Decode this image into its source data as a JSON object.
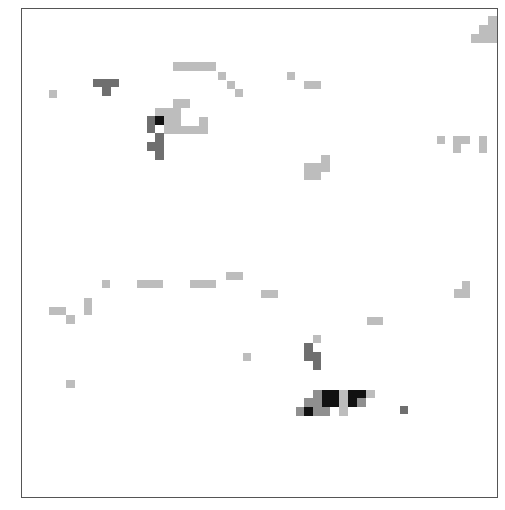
{
  "chart_data": {
    "type": "heatmap",
    "title": "",
    "xlabel": "",
    "ylabel": "",
    "grid": false,
    "legend": null,
    "frame": {
      "x": 21,
      "y": 8,
      "width": 477,
      "height": 490
    },
    "palette": {
      "light": "#bdbdbd",
      "mid": "#8f8f8f",
      "dark": "#6f6f6f",
      "black": "#111111"
    },
    "cells": [
      {
        "x": 488,
        "y": 16,
        "w": 9,
        "h": 9,
        "level": "light"
      },
      {
        "x": 479,
        "y": 25,
        "w": 18,
        "h": 9,
        "level": "light"
      },
      {
        "x": 471,
        "y": 34,
        "w": 26,
        "h": 9,
        "level": "light"
      },
      {
        "x": 173,
        "y": 62,
        "w": 43,
        "h": 9,
        "level": "light"
      },
      {
        "x": 218,
        "y": 72,
        "w": 8,
        "h": 8,
        "level": "light"
      },
      {
        "x": 227,
        "y": 81,
        "w": 8,
        "h": 8,
        "level": "light"
      },
      {
        "x": 235,
        "y": 89,
        "w": 8,
        "h": 8,
        "level": "light"
      },
      {
        "x": 287,
        "y": 72,
        "w": 8,
        "h": 8,
        "level": "light"
      },
      {
        "x": 304,
        "y": 81,
        "w": 17,
        "h": 8,
        "level": "light"
      },
      {
        "x": 49,
        "y": 90,
        "w": 8,
        "h": 8,
        "level": "light"
      },
      {
        "x": 93,
        "y": 79,
        "w": 26,
        "h": 8,
        "level": "dark"
      },
      {
        "x": 102,
        "y": 87,
        "w": 9,
        "h": 9,
        "level": "dark"
      },
      {
        "x": 173,
        "y": 99,
        "w": 17,
        "h": 9,
        "level": "light"
      },
      {
        "x": 155,
        "y": 108,
        "w": 26,
        "h": 9,
        "level": "light"
      },
      {
        "x": 164,
        "y": 117,
        "w": 17,
        "h": 9,
        "level": "light"
      },
      {
        "x": 199,
        "y": 117,
        "w": 9,
        "h": 9,
        "level": "light"
      },
      {
        "x": 164,
        "y": 126,
        "w": 44,
        "h": 8,
        "level": "light"
      },
      {
        "x": 147,
        "y": 116,
        "w": 8,
        "h": 17,
        "level": "dark"
      },
      {
        "x": 155,
        "y": 116,
        "w": 9,
        "h": 9,
        "level": "black"
      },
      {
        "x": 155,
        "y": 133,
        "w": 9,
        "h": 9,
        "level": "dark"
      },
      {
        "x": 147,
        "y": 142,
        "w": 17,
        "h": 9,
        "level": "dark"
      },
      {
        "x": 155,
        "y": 151,
        "w": 9,
        "h": 9,
        "level": "dark"
      },
      {
        "x": 437,
        "y": 136,
        "w": 8,
        "h": 8,
        "level": "light"
      },
      {
        "x": 453,
        "y": 136,
        "w": 17,
        "h": 8,
        "level": "light"
      },
      {
        "x": 453,
        "y": 144,
        "w": 8,
        "h": 9,
        "level": "light"
      },
      {
        "x": 479,
        "y": 136,
        "w": 8,
        "h": 17,
        "level": "light"
      },
      {
        "x": 321,
        "y": 155,
        "w": 9,
        "h": 9,
        "level": "light"
      },
      {
        "x": 304,
        "y": 163,
        "w": 26,
        "h": 9,
        "level": "light"
      },
      {
        "x": 304,
        "y": 172,
        "w": 17,
        "h": 8,
        "level": "light"
      },
      {
        "x": 226,
        "y": 272,
        "w": 17,
        "h": 8,
        "level": "light"
      },
      {
        "x": 102,
        "y": 280,
        "w": 8,
        "h": 8,
        "level": "light"
      },
      {
        "x": 137,
        "y": 280,
        "w": 26,
        "h": 8,
        "level": "light"
      },
      {
        "x": 190,
        "y": 280,
        "w": 26,
        "h": 8,
        "level": "light"
      },
      {
        "x": 261,
        "y": 290,
        "w": 17,
        "h": 8,
        "level": "light"
      },
      {
        "x": 462,
        "y": 281,
        "w": 8,
        "h": 8,
        "level": "light"
      },
      {
        "x": 454,
        "y": 289,
        "w": 16,
        "h": 9,
        "level": "light"
      },
      {
        "x": 84,
        "y": 298,
        "w": 8,
        "h": 17,
        "level": "light"
      },
      {
        "x": 49,
        "y": 307,
        "w": 17,
        "h": 8,
        "level": "light"
      },
      {
        "x": 66,
        "y": 315,
        "w": 9,
        "h": 9,
        "level": "light"
      },
      {
        "x": 367,
        "y": 317,
        "w": 16,
        "h": 8,
        "level": "light"
      },
      {
        "x": 313,
        "y": 335,
        "w": 8,
        "h": 8,
        "level": "light"
      },
      {
        "x": 304,
        "y": 343,
        "w": 9,
        "h": 18,
        "level": "dark"
      },
      {
        "x": 313,
        "y": 352,
        "w": 8,
        "h": 18,
        "level": "dark"
      },
      {
        "x": 243,
        "y": 353,
        "w": 8,
        "h": 8,
        "level": "light"
      },
      {
        "x": 66,
        "y": 380,
        "w": 9,
        "h": 8,
        "level": "light"
      },
      {
        "x": 313,
        "y": 390,
        "w": 9,
        "h": 8,
        "level": "mid"
      },
      {
        "x": 322,
        "y": 390,
        "w": 17,
        "h": 17,
        "level": "black"
      },
      {
        "x": 339,
        "y": 390,
        "w": 9,
        "h": 26,
        "level": "light"
      },
      {
        "x": 348,
        "y": 390,
        "w": 18,
        "h": 8,
        "level": "black"
      },
      {
        "x": 366,
        "y": 390,
        "w": 9,
        "h": 8,
        "level": "light"
      },
      {
        "x": 304,
        "y": 398,
        "w": 18,
        "h": 9,
        "level": "mid"
      },
      {
        "x": 348,
        "y": 398,
        "w": 9,
        "h": 9,
        "level": "black"
      },
      {
        "x": 357,
        "y": 398,
        "w": 9,
        "h": 9,
        "level": "mid"
      },
      {
        "x": 296,
        "y": 407,
        "w": 8,
        "h": 9,
        "level": "mid"
      },
      {
        "x": 304,
        "y": 407,
        "w": 9,
        "h": 9,
        "level": "black"
      },
      {
        "x": 313,
        "y": 407,
        "w": 17,
        "h": 9,
        "level": "mid"
      },
      {
        "x": 400,
        "y": 406,
        "w": 8,
        "h": 8,
        "level": "dark"
      }
    ]
  }
}
